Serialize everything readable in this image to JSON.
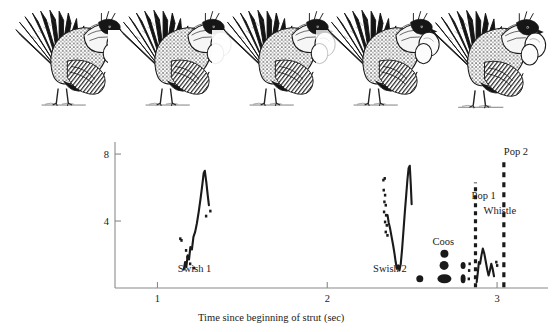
{
  "figure": {
    "name": "sage-grouse-strut-display-spectrogram",
    "background_color": "#ffffff",
    "ink_color": "#1a1a1a",
    "axis_color": "#8a8a8a"
  },
  "bird_sequence": {
    "name": "strut-pose-sequence",
    "count": 5,
    "poses": [
      {
        "id": "pose-1",
        "label": "tail fanned, air sacs not inflated",
        "x": 22,
        "sac_scale": 0.0
      },
      {
        "id": "pose-2",
        "label": "tail fanned, wings starting swish",
        "x": 128,
        "sac_scale": 0.1
      },
      {
        "id": "pose-3",
        "label": "wings drawn back, chest raised",
        "x": 236,
        "sac_scale": 0.25
      },
      {
        "id": "pose-4",
        "label": "air sacs partially inflated",
        "x": 340,
        "sac_scale": 0.75
      },
      {
        "id": "pose-5",
        "label": "air sacs fully inflated, pop",
        "x": 444,
        "sac_scale": 1.0
      }
    ]
  },
  "chart_data": {
    "type": "line",
    "title": "",
    "xlabel": "Time since beginning of strut (sec)",
    "ylabel": "Frequency (kHz)",
    "xlim": [
      0.75,
      3.3
    ],
    "ylim": [
      0,
      8.6
    ],
    "xticks": [
      1,
      2,
      3
    ],
    "xtick_labels": [
      "1",
      "2",
      "3"
    ],
    "yticks": [
      4,
      8
    ],
    "ytick_labels": [
      "4",
      "8"
    ],
    "grid": false,
    "legend": null,
    "annotations": [
      {
        "text": "Swish 1",
        "x": 1.12,
        "y": 0.95,
        "anchor": "start"
      },
      {
        "text": "Swish 2",
        "x": 2.27,
        "y": 0.95,
        "anchor": "start"
      },
      {
        "text": "Coos",
        "x": 2.62,
        "y": 2.55,
        "anchor": "start"
      },
      {
        "text": "Pop 1",
        "x": 2.85,
        "y": 5.3,
        "anchor": "start"
      },
      {
        "text": "Whistle",
        "x": 2.92,
        "y": 4.4,
        "anchor": "start"
      },
      {
        "text": "Pop 2",
        "x": 3.04,
        "y": 7.95,
        "anchor": "start"
      }
    ],
    "series": [
      {
        "name": "Swish 1",
        "style": "solid-trace",
        "points": [
          [
            1.155,
            1.1
          ],
          [
            1.163,
            1.55
          ],
          [
            1.17,
            1.25
          ],
          [
            1.178,
            1.95
          ],
          [
            1.186,
            1.7
          ],
          [
            1.194,
            2.45
          ],
          [
            1.203,
            2.3
          ],
          [
            1.212,
            3.05
          ],
          [
            1.222,
            3.35
          ],
          [
            1.232,
            3.85
          ],
          [
            1.243,
            4.55
          ],
          [
            1.254,
            5.35
          ],
          [
            1.264,
            6.15
          ],
          [
            1.272,
            6.85
          ],
          [
            1.279,
            7.0
          ],
          [
            1.288,
            6.3
          ],
          [
            1.296,
            5.55
          ],
          [
            1.303,
            4.95
          ]
        ]
      },
      {
        "name": "Swish 1 speckle",
        "style": "speckle",
        "points": [
          [
            1.134,
            2.95
          ],
          [
            1.141,
            2.85
          ],
          [
            1.168,
            2.25
          ],
          [
            1.176,
            1.85
          ],
          [
            1.192,
            1.45
          ],
          [
            1.214,
            1.2
          ],
          [
            1.286,
            4.3
          ],
          [
            1.311,
            4.6
          ]
        ]
      },
      {
        "name": "Swish 2",
        "style": "solid-trace",
        "points": [
          [
            2.355,
            4.35
          ],
          [
            2.362,
            3.9
          ],
          [
            2.37,
            3.55
          ],
          [
            2.379,
            3.05
          ],
          [
            2.388,
            2.55
          ],
          [
            2.396,
            2.05
          ],
          [
            2.403,
            1.55
          ],
          [
            2.41,
            1.15
          ],
          [
            2.418,
            1.35
          ],
          [
            2.425,
            1.05
          ],
          [
            2.433,
            1.45
          ],
          [
            2.441,
            2.35
          ],
          [
            2.449,
            3.45
          ],
          [
            2.457,
            4.55
          ],
          [
            2.465,
            5.55
          ],
          [
            2.472,
            6.45
          ],
          [
            2.479,
            7.15
          ],
          [
            2.486,
            7.3
          ],
          [
            2.492,
            6.15
          ],
          [
            2.497,
            5.0
          ]
        ]
      },
      {
        "name": "Swish 2 speckle",
        "style": "speckle",
        "points": [
          [
            2.33,
            6.45
          ],
          [
            2.338,
            6.55
          ],
          [
            2.332,
            5.85
          ],
          [
            2.34,
            5.55
          ],
          [
            2.336,
            5.15
          ],
          [
            2.344,
            4.95
          ],
          [
            2.334,
            4.55
          ],
          [
            2.346,
            4.35
          ],
          [
            2.34,
            3.95
          ],
          [
            2.35,
            3.75
          ],
          [
            2.344,
            3.35
          ],
          [
            2.354,
            3.15
          ]
        ]
      },
      {
        "name": "Coos",
        "style": "blob-harmonics",
        "blobs": [
          [
            2.545,
            0.55,
            7,
            7
          ],
          [
            2.69,
            0.55,
            14,
            9
          ],
          [
            2.688,
            1.35,
            9,
            9
          ],
          [
            2.69,
            2.05,
            8,
            8
          ],
          [
            2.8,
            0.55,
            5,
            9
          ],
          [
            2.8,
            1.35,
            5,
            7
          ]
        ]
      },
      {
        "name": "Pop 1",
        "style": "vertical-broadband",
        "x": 2.873,
        "y_from": 0.05,
        "y_to": 6.3,
        "dash": "4 4"
      },
      {
        "name": "Whistle",
        "style": "solid-trace",
        "points": [
          [
            2.88,
            0.35
          ],
          [
            2.887,
            0.95
          ],
          [
            2.893,
            1.55
          ],
          [
            2.9,
            1.45
          ],
          [
            2.908,
            1.95
          ],
          [
            2.916,
            2.35
          ],
          [
            2.925,
            2.05
          ],
          [
            2.934,
            1.55
          ],
          [
            2.942,
            1.1
          ],
          [
            2.95,
            0.75
          ],
          [
            2.958,
            1.05
          ],
          [
            2.966,
            1.45
          ],
          [
            2.974,
            1.15
          ],
          [
            2.982,
            0.7
          ]
        ]
      },
      {
        "name": "Whistle speckle",
        "style": "speckle",
        "points": [
          [
            2.995,
            1.55
          ],
          [
            3.0,
            1.35
          ],
          [
            2.835,
            1.05
          ],
          [
            2.833,
            0.55
          ],
          [
            2.838,
            1.45
          ]
        ]
      },
      {
        "name": "Pop 2",
        "style": "vertical-broadband",
        "x": 3.04,
        "y_from": 0.05,
        "y_to": 7.7,
        "dash": "5 5"
      }
    ]
  }
}
